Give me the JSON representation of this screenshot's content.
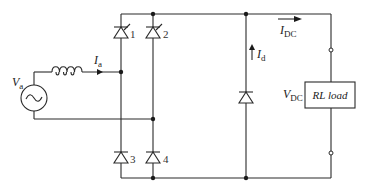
{
  "diagram": {
    "type": "circuit",
    "source": {
      "label": "V",
      "subscript": "a",
      "icon": "ac-source-icon"
    },
    "inductor": {
      "icon": "inductor-icon"
    },
    "currents": {
      "ia": {
        "label": "I",
        "subscript": "a"
      },
      "idc": {
        "label": "I",
        "subscript": "DC"
      },
      "id": {
        "label": "I",
        "subscript": "d"
      }
    },
    "devices": [
      {
        "id": "1",
        "kind": "thyristor",
        "label": "1"
      },
      {
        "id": "2",
        "kind": "thyristor",
        "label": "2"
      },
      {
        "id": "3",
        "kind": "diode",
        "label": "3"
      },
      {
        "id": "4",
        "kind": "diode",
        "label": "4"
      },
      {
        "id": "fw",
        "kind": "diode",
        "label": ""
      }
    ],
    "output_voltage": {
      "label": "V",
      "subscript": "DC"
    },
    "load": {
      "label": "RL load"
    },
    "colors": {
      "wire": "#2a2a2a",
      "background": "#ffffff"
    }
  }
}
